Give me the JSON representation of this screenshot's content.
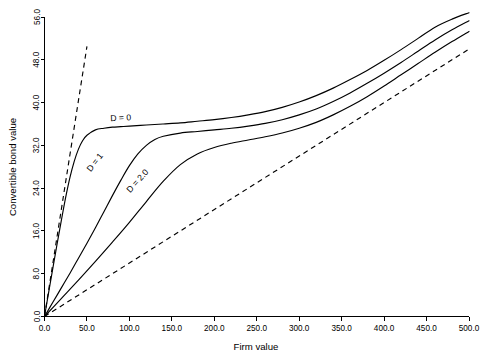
{
  "chart_data": {
    "type": "line",
    "title": "",
    "xlabel": "Firm value",
    "ylabel": "Convertible bond value",
    "xlim": [
      0.0,
      500.0
    ],
    "ylim": [
      0.0,
      56.0
    ],
    "grid": false,
    "legend_position": "inline-annotations",
    "xticks": [
      "0.0",
      "50.0",
      "100.0",
      "150.0",
      "200.0",
      "250.0",
      "300.0",
      "350.0",
      "400.0",
      "450.0",
      "500.0"
    ],
    "xtick_values": [
      0,
      50,
      100,
      150,
      200,
      250,
      300,
      350,
      400,
      450,
      500
    ],
    "yticks": [
      "0.0",
      "8.0",
      "16.0",
      "24.0",
      "32.0",
      "40.0",
      "48.0",
      "56.0"
    ],
    "ytick_values": [
      0,
      8,
      16,
      24,
      32,
      40,
      48,
      56
    ],
    "series": [
      {
        "name": "D = 0",
        "style": "solid",
        "label": "D = 0",
        "label_x": 90,
        "label_y": 36.6,
        "label_rotation": -3,
        "x": [
          0,
          5,
          10,
          15,
          20,
          25,
          30,
          35,
          40,
          45,
          50,
          60,
          70,
          80,
          90,
          100,
          120,
          140,
          160,
          180,
          200,
          220,
          240,
          260,
          280,
          300,
          320,
          340,
          360,
          380,
          400,
          420,
          440,
          460,
          480,
          500
        ],
        "y": [
          0.0,
          4.6,
          9.2,
          13.7,
          18.1,
          22.3,
          26.0,
          29.0,
          31.3,
          32.9,
          33.9,
          34.9,
          35.2,
          35.4,
          35.5,
          35.6,
          35.8,
          36.0,
          36.2,
          36.5,
          36.8,
          37.2,
          37.7,
          38.3,
          39.1,
          40.1,
          41.3,
          42.7,
          44.3,
          46.0,
          47.9,
          49.9,
          52.0,
          54.1,
          55.6,
          56.8
        ]
      },
      {
        "name": "D = 1",
        "style": "solid",
        "label": "D = 1",
        "label_x": 62,
        "label_y": 28.5,
        "label_rotation": -52,
        "x": [
          0,
          10,
          20,
          30,
          40,
          50,
          60,
          70,
          80,
          90,
          100,
          110,
          120,
          130,
          140,
          160,
          180,
          200,
          220,
          240,
          260,
          280,
          300,
          320,
          340,
          360,
          380,
          400,
          420,
          440,
          460,
          480,
          500
        ],
        "y": [
          0.0,
          2.7,
          5.4,
          8.1,
          10.9,
          13.7,
          16.6,
          19.6,
          22.6,
          25.5,
          28.2,
          30.4,
          32.0,
          33.1,
          33.7,
          34.3,
          34.6,
          34.9,
          35.2,
          35.6,
          36.1,
          36.8,
          37.7,
          38.8,
          40.2,
          41.8,
          43.6,
          45.5,
          47.5,
          49.6,
          51.7,
          53.6,
          55.3
        ]
      },
      {
        "name": "D = 2.0",
        "style": "solid",
        "label": "D = 2.0",
        "label_x": 112,
        "label_y": 25.0,
        "label_rotation": -48,
        "x": [
          0,
          20,
          40,
          60,
          80,
          100,
          120,
          140,
          160,
          180,
          200,
          220,
          240,
          260,
          280,
          300,
          320,
          340,
          360,
          380,
          400,
          420,
          440,
          460,
          480,
          500
        ],
        "y": [
          0.0,
          3.4,
          6.8,
          10.3,
          13.9,
          17.6,
          21.5,
          25.3,
          28.4,
          30.4,
          31.6,
          32.4,
          33.0,
          33.6,
          34.3,
          35.2,
          36.3,
          37.7,
          39.3,
          41.1,
          43.1,
          45.2,
          47.3,
          49.4,
          51.4,
          53.3
        ]
      },
      {
        "name": "steep-dashed-reference",
        "style": "dashed",
        "label": "",
        "x": [
          0,
          50
        ],
        "y": [
          0.0,
          50.5
        ]
      },
      {
        "name": "lower-dashed-reference",
        "style": "dashed",
        "label": "",
        "x": [
          0,
          500
        ],
        "y": [
          0.0,
          50.0
        ]
      }
    ]
  }
}
